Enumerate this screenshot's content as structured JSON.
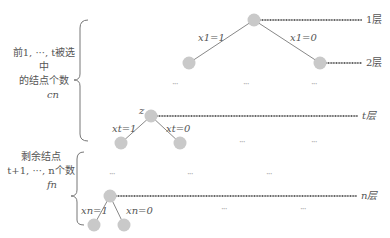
{
  "diagram": {
    "left_annotations": {
      "top_group": {
        "line1": "前1, ···, t被选中",
        "line2": "的结点个数",
        "var": "cn"
      },
      "bottom_group": {
        "line1": "剩余结点",
        "line2": "t+1, ···, n个数",
        "var": "fn"
      }
    },
    "levels": [
      {
        "label": "1层"
      },
      {
        "label": "2层"
      },
      {
        "label": "t层"
      },
      {
        "label": "n层"
      }
    ],
    "edges": {
      "x1_left": "x1=1",
      "x1_right": "x1=0",
      "xt_left": "xt=1",
      "xt_right": "xt=0",
      "xn_left": "xn=1",
      "xn_right": "xn=0"
    },
    "node_labels": {
      "z": "z"
    },
    "ellipsis": "···",
    "colors": {
      "node_fill": "#c8c8c8",
      "edge": "#888888",
      "level_line": "#555555",
      "text": "#555555"
    }
  }
}
